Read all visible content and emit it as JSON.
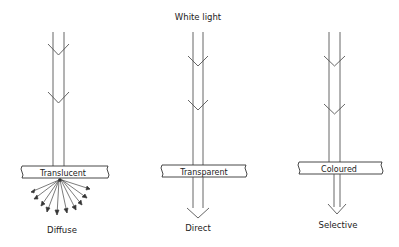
{
  "title": "White light",
  "colors": {
    "line": "#555555",
    "text": "#222222",
    "background": "#ffffff"
  },
  "materials": [
    {
      "id": "translucent",
      "panel_label": "Translucent",
      "result_label": "Diffuse",
      "transmission": "scattered rays"
    },
    {
      "id": "transparent",
      "panel_label": "Transparent",
      "result_label": "Direct",
      "transmission": "full-width beam"
    },
    {
      "id": "coloured",
      "panel_label": "Coloured",
      "result_label": "Selective",
      "transmission": "narrowed beam"
    }
  ]
}
